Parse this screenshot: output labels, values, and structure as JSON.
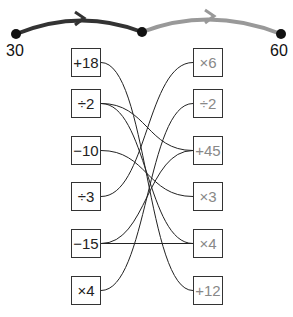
{
  "number_line": {
    "start_label": "30",
    "end_label": "60",
    "arc1_color": "#333333",
    "arc2_color": "#999999"
  },
  "left_ops": [
    {
      "label": "+18",
      "y": 48
    },
    {
      "label": "÷2",
      "y": 89
    },
    {
      "label": "−10",
      "y": 136
    },
    {
      "label": "÷3",
      "y": 182
    },
    {
      "label": "−15",
      "y": 229
    },
    {
      "label": "×4",
      "y": 276
    }
  ],
  "right_ops": [
    {
      "label": "×6",
      "y": 48
    },
    {
      "label": "÷2",
      "y": 89
    },
    {
      "label": "+45",
      "y": 136
    },
    {
      "label": "×3",
      "y": 182
    },
    {
      "label": "×4",
      "y": 229
    },
    {
      "label": "+12",
      "y": 276
    }
  ],
  "connections": [
    {
      "from": 0,
      "to": 5
    },
    {
      "from": 1,
      "to": 2
    },
    {
      "from": 1,
      "to": 4
    },
    {
      "from": 2,
      "to": 3
    },
    {
      "from": 3,
      "to": 0
    },
    {
      "from": 4,
      "to": 2
    },
    {
      "from": 4,
      "to": 4
    },
    {
      "from": 5,
      "to": 1
    }
  ]
}
